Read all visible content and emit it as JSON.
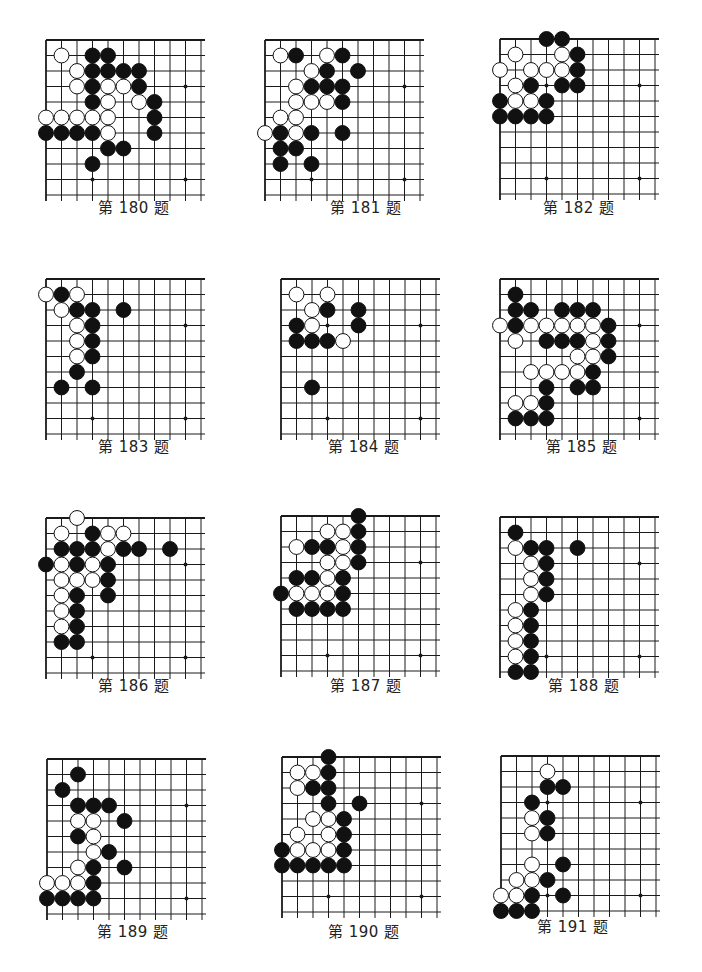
{
  "page": {
    "grid": {
      "cols": 11,
      "rows": 11,
      "step": 15.5,
      "line_color": "#1a1a1a",
      "black": "#111111",
      "white": "#ffffff"
    }
  },
  "problems": [
    {
      "label": "第 180 题",
      "x": 46,
      "y": 40,
      "caption_x": 98,
      "caption_y": 205,
      "stars": [
        [
          3,
          9
        ],
        [
          9,
          3
        ],
        [
          9,
          9
        ]
      ],
      "black": [
        [
          3,
          1
        ],
        [
          4,
          1
        ],
        [
          3,
          2
        ],
        [
          4,
          2
        ],
        [
          5,
          2
        ],
        [
          6,
          2
        ],
        [
          3,
          3
        ],
        [
          6,
          3
        ],
        [
          3,
          4
        ],
        [
          7,
          4
        ],
        [
          7,
          5
        ],
        [
          0,
          6
        ],
        [
          1,
          6
        ],
        [
          2,
          6
        ],
        [
          3,
          6
        ],
        [
          7,
          6
        ],
        [
          4,
          7
        ],
        [
          5,
          7
        ],
        [
          3,
          8
        ]
      ],
      "white": [
        [
          1,
          1
        ],
        [
          2,
          2
        ],
        [
          2,
          3
        ],
        [
          4,
          3
        ],
        [
          5,
          3
        ],
        [
          4,
          4
        ],
        [
          6,
          4
        ],
        [
          0,
          5
        ],
        [
          1,
          5
        ],
        [
          2,
          5
        ],
        [
          3,
          5
        ],
        [
          4,
          5
        ],
        [
          4,
          6
        ]
      ]
    },
    {
      "label": "第 181 题",
      "x": 265,
      "y": 40,
      "caption_x": 330,
      "caption_y": 205,
      "stars": [
        [
          3,
          9
        ],
        [
          9,
          3
        ],
        [
          9,
          9
        ]
      ],
      "black": [
        [
          2,
          1
        ],
        [
          5,
          1
        ],
        [
          4,
          2
        ],
        [
          6,
          2
        ],
        [
          3,
          3
        ],
        [
          4,
          3
        ],
        [
          5,
          3
        ],
        [
          5,
          4
        ],
        [
          1,
          6
        ],
        [
          3,
          6
        ],
        [
          5,
          6
        ],
        [
          1,
          7
        ],
        [
          2,
          7
        ],
        [
          1,
          8
        ],
        [
          3,
          8
        ]
      ],
      "white": [
        [
          1,
          1
        ],
        [
          4,
          1
        ],
        [
          3,
          2
        ],
        [
          2,
          3
        ],
        [
          2,
          4
        ],
        [
          3,
          4
        ],
        [
          4,
          4
        ],
        [
          1,
          5
        ],
        [
          2,
          5
        ],
        [
          0,
          6
        ],
        [
          2,
          6
        ]
      ]
    },
    {
      "label": "第 182 题",
      "x": 500,
      "y": 39,
      "caption_x": 543,
      "caption_y": 205,
      "stars": [
        [
          3,
          3
        ],
        [
          9,
          3
        ],
        [
          3,
          9
        ],
        [
          9,
          9
        ]
      ],
      "black": [
        [
          3,
          0
        ],
        [
          4,
          0
        ],
        [
          5,
          1
        ],
        [
          5,
          2
        ],
        [
          2,
          3
        ],
        [
          4,
          3
        ],
        [
          5,
          3
        ],
        [
          0,
          4
        ],
        [
          3,
          4
        ],
        [
          0,
          5
        ],
        [
          1,
          5
        ],
        [
          2,
          5
        ],
        [
          3,
          5
        ]
      ],
      "white": [
        [
          1,
          1
        ],
        [
          4,
          1
        ],
        [
          0,
          2
        ],
        [
          2,
          2
        ],
        [
          3,
          2
        ],
        [
          4,
          2
        ],
        [
          1,
          3
        ],
        [
          1,
          4
        ],
        [
          2,
          4
        ]
      ]
    },
    {
      "label": "第 183 题",
      "x": 46,
      "y": 279,
      "caption_x": 98,
      "caption_y": 444,
      "stars": [
        [
          3,
          9
        ],
        [
          9,
          3
        ],
        [
          9,
          9
        ]
      ],
      "black": [
        [
          1,
          1
        ],
        [
          2,
          2
        ],
        [
          3,
          2
        ],
        [
          5,
          2
        ],
        [
          3,
          3
        ],
        [
          3,
          4
        ],
        [
          3,
          5
        ],
        [
          2,
          6
        ],
        [
          1,
          7
        ],
        [
          3,
          7
        ]
      ],
      "white": [
        [
          0,
          1
        ],
        [
          2,
          1
        ],
        [
          1,
          2
        ],
        [
          2,
          3
        ],
        [
          2,
          4
        ],
        [
          2,
          5
        ]
      ]
    },
    {
      "label": "第 184 题",
      "x": 281,
      "y": 279,
      "caption_x": 328,
      "caption_y": 444,
      "stars": [
        [
          3,
          3
        ],
        [
          3,
          9
        ],
        [
          9,
          3
        ],
        [
          9,
          9
        ]
      ],
      "black": [
        [
          3,
          2
        ],
        [
          5,
          2
        ],
        [
          1,
          3
        ],
        [
          5,
          3
        ],
        [
          1,
          4
        ],
        [
          2,
          4
        ],
        [
          3,
          4
        ],
        [
          2,
          7
        ]
      ],
      "white": [
        [
          1,
          1
        ],
        [
          3,
          1
        ],
        [
          2,
          2
        ],
        [
          2,
          3
        ],
        [
          4,
          4
        ]
      ]
    },
    {
      "label": "第 185 题",
      "x": 500,
      "y": 279,
      "caption_x": 546,
      "caption_y": 444,
      "stars": [
        [
          9,
          3
        ],
        [
          9,
          9
        ]
      ],
      "black": [
        [
          1,
          1
        ],
        [
          1,
          2
        ],
        [
          2,
          2
        ],
        [
          4,
          2
        ],
        [
          5,
          2
        ],
        [
          6,
          2
        ],
        [
          1,
          3
        ],
        [
          7,
          3
        ],
        [
          3,
          4
        ],
        [
          4,
          4
        ],
        [
          5,
          4
        ],
        [
          7,
          4
        ],
        [
          7,
          5
        ],
        [
          6,
          6
        ],
        [
          3,
          7
        ],
        [
          5,
          7
        ],
        [
          6,
          7
        ],
        [
          3,
          8
        ],
        [
          1,
          9
        ],
        [
          2,
          9
        ],
        [
          3,
          9
        ]
      ],
      "white": [
        [
          0,
          3
        ],
        [
          2,
          3
        ],
        [
          3,
          3
        ],
        [
          4,
          3
        ],
        [
          5,
          3
        ],
        [
          6,
          3
        ],
        [
          1,
          4
        ],
        [
          6,
          4
        ],
        [
          5,
          5
        ],
        [
          6,
          5
        ],
        [
          2,
          6
        ],
        [
          3,
          6
        ],
        [
          4,
          6
        ],
        [
          5,
          6
        ],
        [
          1,
          8
        ],
        [
          2,
          8
        ]
      ]
    },
    {
      "label": "第 186 题",
      "x": 46,
      "y": 518,
      "caption_x": 98,
      "caption_y": 683,
      "stars": [
        [
          3,
          9
        ],
        [
          9,
          3
        ],
        [
          9,
          9
        ]
      ],
      "black": [
        [
          3,
          1
        ],
        [
          1,
          2
        ],
        [
          2,
          2
        ],
        [
          3,
          2
        ],
        [
          5,
          2
        ],
        [
          6,
          2
        ],
        [
          8,
          2
        ],
        [
          0,
          3
        ],
        [
          2,
          3
        ],
        [
          4,
          3
        ],
        [
          4,
          4
        ],
        [
          2,
          5
        ],
        [
          4,
          5
        ],
        [
          2,
          6
        ],
        [
          2,
          7
        ],
        [
          1,
          8
        ],
        [
          2,
          8
        ]
      ],
      "white": [
        [
          2,
          0
        ],
        [
          1,
          1
        ],
        [
          4,
          1
        ],
        [
          5,
          1
        ],
        [
          4,
          2
        ],
        [
          1,
          3
        ],
        [
          3,
          3
        ],
        [
          1,
          4
        ],
        [
          2,
          4
        ],
        [
          3,
          4
        ],
        [
          1,
          5
        ],
        [
          1,
          6
        ],
        [
          1,
          7
        ]
      ]
    },
    {
      "label": "第 187 题",
      "x": 281,
      "y": 516,
      "caption_x": 330,
      "caption_y": 683,
      "stars": [
        [
          3,
          9
        ],
        [
          9,
          3
        ],
        [
          9,
          9
        ]
      ],
      "black": [
        [
          5,
          0
        ],
        [
          5,
          1
        ],
        [
          2,
          2
        ],
        [
          3,
          2
        ],
        [
          5,
          2
        ],
        [
          5,
          3
        ],
        [
          1,
          4
        ],
        [
          2,
          4
        ],
        [
          4,
          4
        ],
        [
          0,
          5
        ],
        [
          4,
          5
        ],
        [
          1,
          6
        ],
        [
          2,
          6
        ],
        [
          3,
          6
        ],
        [
          4,
          6
        ]
      ],
      "white": [
        [
          3,
          1
        ],
        [
          4,
          1
        ],
        [
          1,
          2
        ],
        [
          4,
          2
        ],
        [
          3,
          3
        ],
        [
          4,
          3
        ],
        [
          3,
          4
        ],
        [
          1,
          5
        ],
        [
          2,
          5
        ],
        [
          3,
          5
        ]
      ]
    },
    {
      "label": "第 188 题",
      "x": 500,
      "y": 517,
      "caption_x": 548,
      "caption_y": 683,
      "stars": [
        [
          3,
          9
        ],
        [
          9,
          3
        ],
        [
          9,
          9
        ]
      ],
      "black": [
        [
          1,
          1
        ],
        [
          2,
          2
        ],
        [
          3,
          2
        ],
        [
          5,
          2
        ],
        [
          3,
          3
        ],
        [
          3,
          4
        ],
        [
          3,
          5
        ],
        [
          2,
          6
        ],
        [
          2,
          7
        ],
        [
          2,
          8
        ],
        [
          2,
          9
        ],
        [
          1,
          10
        ],
        [
          2,
          10
        ]
      ],
      "white": [
        [
          1,
          2
        ],
        [
          2,
          3
        ],
        [
          2,
          4
        ],
        [
          2,
          5
        ],
        [
          1,
          6
        ],
        [
          1,
          7
        ],
        [
          1,
          8
        ],
        [
          1,
          9
        ]
      ]
    },
    {
      "label": "第 189 题",
      "x": 47,
      "y": 759,
      "caption_x": 97,
      "caption_y": 929,
      "stars": [
        [
          9,
          3
        ],
        [
          9,
          9
        ]
      ],
      "black": [
        [
          2,
          1
        ],
        [
          1,
          2
        ],
        [
          2,
          3
        ],
        [
          3,
          3
        ],
        [
          4,
          3
        ],
        [
          5,
          4
        ],
        [
          2,
          5
        ],
        [
          4,
          6
        ],
        [
          3,
          7
        ],
        [
          5,
          7
        ],
        [
          3,
          8
        ],
        [
          0,
          9
        ],
        [
          1,
          9
        ],
        [
          2,
          9
        ],
        [
          3,
          9
        ]
      ],
      "white": [
        [
          2,
          4
        ],
        [
          3,
          4
        ],
        [
          3,
          5
        ],
        [
          3,
          6
        ],
        [
          2,
          7
        ],
        [
          0,
          8
        ],
        [
          1,
          8
        ],
        [
          2,
          8
        ]
      ]
    },
    {
      "label": "第 190 题",
      "x": 282,
      "y": 757,
      "caption_x": 328,
      "caption_y": 929,
      "stars": [
        [
          3,
          9
        ],
        [
          9,
          3
        ],
        [
          9,
          9
        ]
      ],
      "black": [
        [
          3,
          0
        ],
        [
          3,
          1
        ],
        [
          2,
          2
        ],
        [
          3,
          2
        ],
        [
          3,
          3
        ],
        [
          5,
          3
        ],
        [
          4,
          4
        ],
        [
          4,
          5
        ],
        [
          0,
          6
        ],
        [
          4,
          6
        ],
        [
          0,
          7
        ],
        [
          1,
          7
        ],
        [
          2,
          7
        ],
        [
          3,
          7
        ],
        [
          4,
          7
        ]
      ],
      "white": [
        [
          1,
          1
        ],
        [
          2,
          1
        ],
        [
          1,
          2
        ],
        [
          2,
          4
        ],
        [
          3,
          4
        ],
        [
          1,
          5
        ],
        [
          3,
          5
        ],
        [
          1,
          6
        ],
        [
          2,
          6
        ],
        [
          3,
          6
        ]
      ]
    },
    {
      "label": "第 191 题",
      "x": 501,
      "y": 756,
      "caption_x": 537,
      "caption_y": 924,
      "stars": [
        [
          3,
          3
        ],
        [
          9,
          3
        ],
        [
          3,
          9
        ],
        [
          9,
          9
        ]
      ],
      "black": [
        [
          3,
          2
        ],
        [
          4,
          2
        ],
        [
          2,
          3
        ],
        [
          3,
          4
        ],
        [
          3,
          5
        ],
        [
          4,
          7
        ],
        [
          3,
          8
        ],
        [
          2,
          9
        ],
        [
          4,
          9
        ],
        [
          0,
          10
        ],
        [
          1,
          10
        ],
        [
          2,
          10
        ]
      ],
      "white": [
        [
          3,
          1
        ],
        [
          2,
          4
        ],
        [
          2,
          5
        ],
        [
          2,
          7
        ],
        [
          1,
          8
        ],
        [
          2,
          8
        ],
        [
          0,
          9
        ],
        [
          1,
          9
        ]
      ]
    }
  ]
}
